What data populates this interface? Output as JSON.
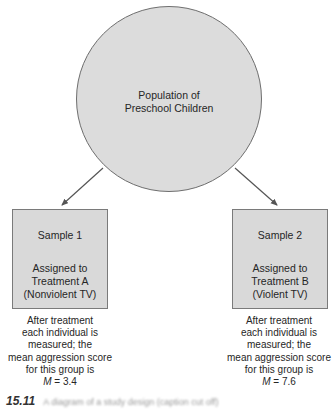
{
  "diagram": {
    "population": {
      "label_line1": "Population of",
      "label_line2": "Preschool Children"
    },
    "samples": [
      {
        "title": "Sample 1",
        "desc_line1": "Assigned to",
        "desc_line2": "Treatment A",
        "desc_line3": "(Nonviolent TV)",
        "result_line1": "After treatment",
        "result_line2": "each individual is",
        "result_line3": "measured; the",
        "result_line4": "mean aggression score",
        "result_line5": "for this group is",
        "result_var": "M",
        "result_value": " = 3.4"
      },
      {
        "title": "Sample 2",
        "desc_line1": "Assigned to",
        "desc_line2": "Treatment B",
        "desc_line3": "(Violent TV)",
        "result_line1": "After treatment",
        "result_line2": "each individual is",
        "result_line3": "measured; the",
        "result_line4": "mean aggression score",
        "result_line5": "for this group is",
        "result_var": "M",
        "result_value": " = 7.6"
      }
    ],
    "caption": {
      "figure_number": "15.11",
      "text_truncated": "A diagram of a study design (caption cut off)"
    },
    "colors": {
      "shape_fill": "#dcdcdc",
      "shape_border": "#6e6e6e",
      "arrow": "#555555",
      "text": "#262626"
    }
  }
}
